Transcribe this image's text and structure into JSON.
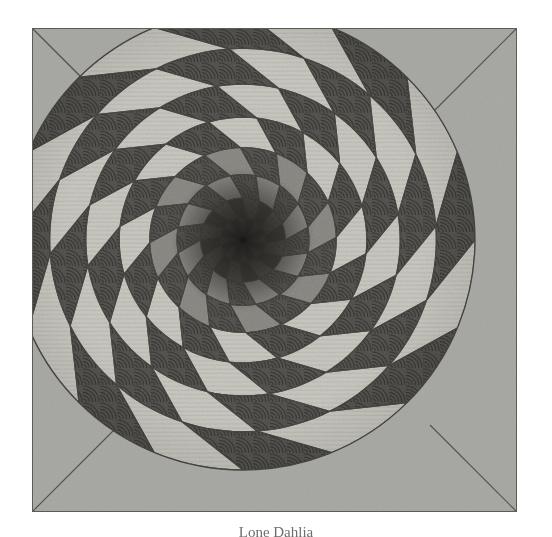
{
  "page": {
    "background_color": "#ffffff",
    "width": 552,
    "height": 537
  },
  "artwork": {
    "title": "Spiral Dahlia Quilt Medallion",
    "medium": "patchwork quilt photograph, greyscale halftone reproduction",
    "frame": {
      "x": 32,
      "y": 28,
      "width": 485,
      "height": 484,
      "background_color": "#a9a9a6",
      "border_color": "#5c5c59",
      "border_width": 1
    },
    "corner_rays": {
      "count": 4,
      "description": "thin straight lines running from each frame corner inward to the circular medallion edge",
      "color": "#4a4a47"
    },
    "medallion": {
      "shape": "circle",
      "center_x": 243,
      "center_y": 240,
      "radius_x": 232,
      "radius_y": 230,
      "outline_color": "#4a4a47",
      "sectors": 16,
      "rings": 9,
      "spiral_twist_degrees": 58,
      "pattern": "log-polar checkerboard of curved patchwork blocks spiralling into a dark centre point"
    },
    "palette": {
      "background_grey": "#a9a9a6",
      "light_patch": "#cfcdc6",
      "light_patch_alt": "#c2c0b8",
      "mid_patch": "#8f8d88",
      "dark_patch": "#565450",
      "darkest_patch": "#3a3936",
      "seam_line": "#45443f",
      "quilting_stitch": "#2f2e2b"
    },
    "quilting_motifs": [
      "concentric arc fans on dark patches",
      "fine horizontal straight-line stitching on light patches",
      "dense stipple / pebble fill near the centre"
    ],
    "center_point": {
      "x": 243,
      "y": 240,
      "color": "#221f1d",
      "note": "all spiral seams converge at a single dark node"
    }
  },
  "caption": {
    "text": "Lone Dahlia",
    "clipped": true,
    "note": "only the top few pixels of the caption line are inside the screenshot"
  }
}
